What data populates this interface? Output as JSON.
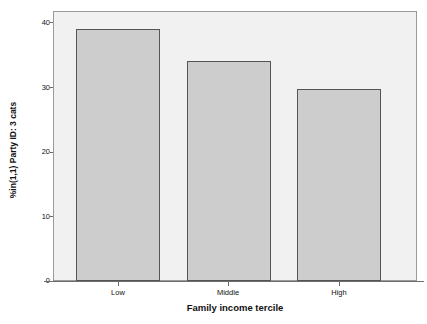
{
  "chart_data": {
    "type": "bar",
    "title": "",
    "xlabel": "Family income tercile",
    "ylabel": "%in(1,1) Party ID: 3 cats",
    "categories": [
      "Low",
      "Middle",
      "High"
    ],
    "values": [
      39.2,
      34.3,
      29.8
    ],
    "series": [
      {
        "name": "%in(1,1) Party ID: 3 cats",
        "values": [
          39.2,
          34.3,
          29.8
        ]
      }
    ],
    "ylim": [
      0,
      42
    ],
    "y_ticks": [
      0,
      10,
      20,
      30,
      40
    ],
    "y_tick_labels": [
      "0",
      "10",
      "20",
      "30",
      "40"
    ],
    "grid": false,
    "legend": false,
    "legend_position": "none",
    "colors": {
      "bar_fill": "#cdcdcd",
      "bar_border": "#555555",
      "plot_background": "#f1f1f1",
      "frame": "#9a9a9a",
      "axis": "#6e6e6e",
      "text": "#111111",
      "page_background": "#ffffff"
    }
  },
  "axes": {
    "y_title": "%in(1,1) Party ID: 3 cats",
    "x_title": "Family income tercile",
    "y_ticks": [
      {
        "label": "40",
        "value": 40
      },
      {
        "label": "30",
        "value": 30
      },
      {
        "label": "20",
        "value": 20
      },
      {
        "label": "10",
        "value": 10
      },
      {
        "label": "0",
        "value": 0
      }
    ],
    "x_ticks": [
      {
        "label": "Low"
      },
      {
        "label": "Middle"
      },
      {
        "label": "High"
      }
    ]
  }
}
